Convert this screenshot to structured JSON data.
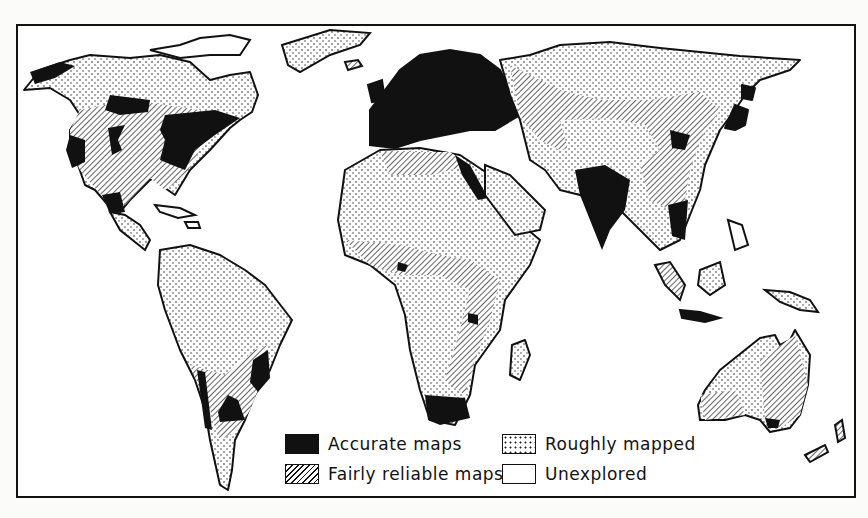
{
  "map": {
    "title": "World map showing state of cartographic knowledge",
    "frame": {
      "x": 17,
      "y": 25,
      "width": 838,
      "height": 472
    },
    "colors": {
      "ink": "#111111",
      "paper": "#fbfbfa"
    }
  },
  "legend": {
    "items": [
      {
        "key": "accurate",
        "label": "Accurate maps",
        "fill": "solid-black"
      },
      {
        "key": "fairly_reliable",
        "label": "Fairly reliable maps",
        "fill": "diagonal-hatch"
      },
      {
        "key": "roughly",
        "label": "Roughly mapped",
        "fill": "dotted"
      },
      {
        "key": "unexplored",
        "label": "Unexplored",
        "fill": "white"
      }
    ]
  }
}
